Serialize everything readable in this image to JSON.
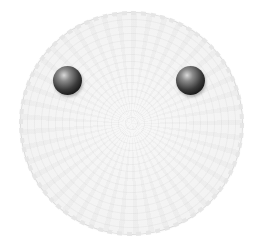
{
  "scene": {
    "subject": "white crocheted doily face",
    "background_color": "#ffffff",
    "doily": {
      "shape": "circle",
      "color": "#f3f3f3",
      "edge": "scalloped",
      "center": [
        131,
        123
      ],
      "radius": 110
    },
    "eyes": [
      {
        "name": "left-eye",
        "center": [
          67,
          80
        ],
        "radius": 14,
        "color": "#111111"
      },
      {
        "name": "right-eye",
        "center": [
          190,
          80
        ],
        "radius": 14,
        "color": "#111111"
      }
    ]
  }
}
